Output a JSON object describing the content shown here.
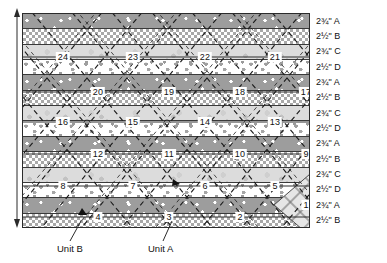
{
  "diagram": {
    "type": "quilt-strip-set-cutting-layout",
    "panel": {
      "width_px": 288,
      "height_px": 215,
      "border_color": "#2b2b2b"
    },
    "stripes": [
      {
        "index": 1,
        "width": "2¾\"",
        "fabric": "A",
        "label": "2¾\" A",
        "pattern": "dark-grey-star-dot"
      },
      {
        "index": 2,
        "width": "2½\"",
        "fabric": "B",
        "label": "2½\" B",
        "pattern": "grey-checker"
      },
      {
        "index": 3,
        "width": "2¾\"",
        "fabric": "C",
        "label": "2¾\" C",
        "pattern": "pale-grey-blotch"
      },
      {
        "index": 4,
        "width": "2½\"",
        "fabric": "D",
        "label": "2½\" D",
        "pattern": "white-grey-dot"
      },
      {
        "index": 5,
        "width": "2¾\"",
        "fabric": "A",
        "label": "2¾\" A",
        "pattern": "dark-grey-star-dot"
      },
      {
        "index": 6,
        "width": "2½\"",
        "fabric": "B",
        "label": "2½\" B",
        "pattern": "grey-checker"
      },
      {
        "index": 7,
        "width": "2¾\"",
        "fabric": "C",
        "label": "2¾\" C",
        "pattern": "pale-grey-blotch"
      },
      {
        "index": 8,
        "width": "2½\"",
        "fabric": "D",
        "label": "2½\" D",
        "pattern": "white-grey-dot"
      },
      {
        "index": 9,
        "width": "2¾\"",
        "fabric": "A",
        "label": "2¾\" A",
        "pattern": "dark-grey-star-dot"
      },
      {
        "index": 10,
        "width": "2½\"",
        "fabric": "B",
        "label": "2½\" B",
        "pattern": "grey-checker"
      },
      {
        "index": 11,
        "width": "2¾\"",
        "fabric": "C",
        "label": "2¾\" C",
        "pattern": "pale-grey-blotch"
      },
      {
        "index": 12,
        "width": "2½\"",
        "fabric": "D",
        "label": "2½\" D",
        "pattern": "white-grey-dot"
      },
      {
        "index": 13,
        "width": "2¾\"",
        "fabric": "A",
        "label": "2¾\" A",
        "pattern": "dark-grey-star-dot"
      },
      {
        "index": 14,
        "width": "2½\"",
        "fabric": "B",
        "label": "2½\" B",
        "pattern": "grey-checker"
      }
    ],
    "blocks": [
      {
        "n": "24",
        "x": 40,
        "y": 43
      },
      {
        "n": "23",
        "x": 110,
        "y": 43
      },
      {
        "n": "22",
        "x": 182,
        "y": 43
      },
      {
        "n": "21",
        "x": 252,
        "y": 43
      },
      {
        "n": "20",
        "x": 75,
        "y": 78
      },
      {
        "n": "19",
        "x": 146,
        "y": 78
      },
      {
        "n": "18",
        "x": 217,
        "y": 78
      },
      {
        "n": "17",
        "x": 287,
        "y": 78
      },
      {
        "n": "16",
        "x": 40,
        "y": 108
      },
      {
        "n": "15",
        "x": 110,
        "y": 108
      },
      {
        "n": "14",
        "x": 182,
        "y": 108
      },
      {
        "n": "13",
        "x": 252,
        "y": 108
      },
      {
        "n": "12",
        "x": 75,
        "y": 140
      },
      {
        "n": "11",
        "x": 146,
        "y": 140
      },
      {
        "n": "10",
        "x": 217,
        "y": 140
      },
      {
        "n": "9",
        "x": 287,
        "y": 140
      },
      {
        "n": "8",
        "x": 40,
        "y": 172
      },
      {
        "n": "7",
        "x": 110,
        "y": 172
      },
      {
        "n": "6",
        "x": 182,
        "y": 172
      },
      {
        "n": "5",
        "x": 252,
        "y": 172
      },
      {
        "n": "4",
        "x": 75,
        "y": 203
      },
      {
        "n": "3",
        "x": 146,
        "y": 203
      },
      {
        "n": "2",
        "x": 217,
        "y": 203
      },
      {
        "n": "1",
        "x": 287,
        "y": 203
      }
    ],
    "callouts": [
      {
        "id": "unit-b",
        "label": "Unit B",
        "marker_x": 81,
        "marker_y": 207
      },
      {
        "id": "unit-a",
        "label": "Unit A",
        "marker_x": 172,
        "marker_y": 178
      }
    ],
    "highlight": {
      "id": "block-1-diamond",
      "description": "diamond lattice shaded unit",
      "center_x": 287,
      "center_y": 191
    },
    "colors": {
      "line": "#2b2b2b",
      "dashed": "#1f1f1f",
      "fabric_a": "#9d9d9d",
      "fabric_b": "#a8a8a8",
      "fabric_c": "#dcdcdc",
      "fabric_d": "#ffffff",
      "text": "#111111"
    }
  }
}
